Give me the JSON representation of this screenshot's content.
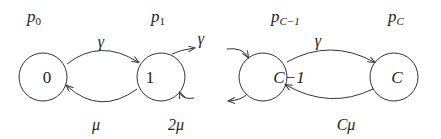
{
  "diagram": {
    "type": "birth-death state transition diagram",
    "states": [
      {
        "id": "0",
        "label": "0",
        "prob_base": "p",
        "prob_sub": "0"
      },
      {
        "id": "1",
        "label": "1",
        "prob_base": "p",
        "prob_sub": "1"
      },
      {
        "id": "C-1",
        "label": "C−1",
        "prob_base": "p",
        "prob_sub": "C−1"
      },
      {
        "id": "C",
        "label": "C",
        "prob_base": "p",
        "prob_sub": "C"
      }
    ],
    "transitions": [
      {
        "from": "0",
        "to": "1",
        "label": "γ"
      },
      {
        "from": "1",
        "to": "0",
        "label": "μ"
      },
      {
        "from": "1",
        "to": "2 (off-diagram)",
        "label": "γ"
      },
      {
        "from": "2 (off-diagram)",
        "to": "1",
        "label": "2μ"
      },
      {
        "from": "C-1",
        "to": "C",
        "label": "γ"
      },
      {
        "from": "C",
        "to": "C-1",
        "label": "Cμ"
      }
    ],
    "colors": {
      "stroke": "#333333",
      "text": "#222222",
      "background": "#ffffff"
    }
  }
}
